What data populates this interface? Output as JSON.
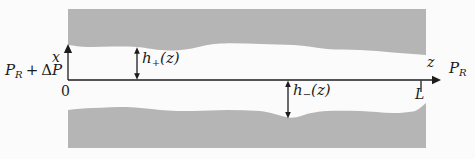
{
  "figure": {
    "bg_color": "#fbfbfb",
    "wall_color": "#b5b5b5",
    "line_color": "#1c1c1c"
  },
  "labels": {
    "x_axis": "x",
    "z_axis": "z",
    "origin": "0",
    "length": "L",
    "pressure_left": {
      "p1": "P",
      "sub": "R",
      "op": "+",
      "delta": "Δ",
      "p2": "P"
    },
    "pressure_right": {
      "p": "P",
      "sub": "R"
    },
    "h_plus": {
      "base": "h",
      "sub": "+",
      "arg": "(z)"
    },
    "h_minus": {
      "base": "h",
      "sub": "−",
      "arg": "(z)"
    }
  }
}
